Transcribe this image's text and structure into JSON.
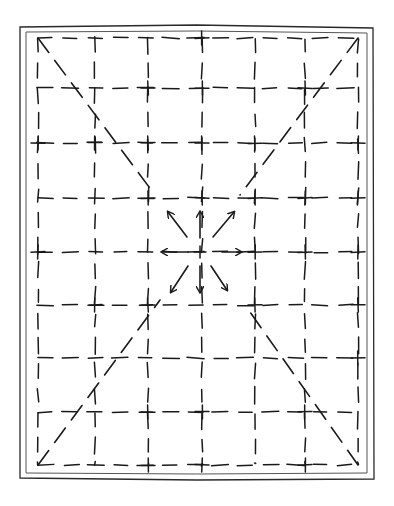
{
  "diagram": {
    "title": "",
    "type": "hand-drawn dashed grid with diagonals and radiating arrows",
    "ink_color": "#1a1a1a",
    "background": "#ffffff",
    "frame": {
      "style": "double-line border",
      "outer": {
        "x": 20,
        "y": 26,
        "w": 353,
        "h": 453
      },
      "inner": {
        "x": 26,
        "y": 31,
        "w": 341,
        "h": 442
      }
    },
    "grid": {
      "style": "dashed",
      "columns_x": [
        38,
        95,
        148,
        202,
        255,
        305,
        358
      ],
      "rows_y": [
        38,
        88,
        143,
        198,
        252,
        305,
        358,
        412,
        465
      ]
    },
    "diagonals": [
      {
        "name": "top-left-to-center",
        "from": [
          38,
          38
        ],
        "to": [
          155,
          195
        ]
      },
      {
        "name": "top-right-to-center",
        "from": [
          358,
          38
        ],
        "to": [
          240,
          195
        ]
      },
      {
        "name": "bottom-left-to-center",
        "from": [
          38,
          465
        ],
        "to": [
          160,
          300
        ]
      },
      {
        "name": "bottom-right-to-center",
        "from": [
          358,
          465
        ],
        "to": [
          245,
          305
        ]
      }
    ],
    "center": {
      "x": 200,
      "y": 252
    },
    "arrows": [
      {
        "direction": "up-left",
        "from": [
          187,
          237
        ],
        "to": [
          168,
          212
        ]
      },
      {
        "direction": "up",
        "from": [
          200,
          238
        ],
        "to": [
          200,
          212
        ]
      },
      {
        "direction": "up-right",
        "from": [
          213,
          237
        ],
        "to": [
          234,
          212
        ]
      },
      {
        "direction": "left",
        "from": [
          188,
          252
        ],
        "to": [
          162,
          252
        ]
      },
      {
        "direction": "right",
        "from": [
          222,
          252
        ],
        "to": [
          241,
          252
        ]
      },
      {
        "direction": "down-left",
        "from": [
          188,
          266
        ],
        "to": [
          171,
          292
        ]
      },
      {
        "direction": "down",
        "from": [
          200,
          266
        ],
        "to": [
          200,
          292
        ]
      },
      {
        "direction": "down-right",
        "from": [
          211,
          266
        ],
        "to": [
          227,
          290
        ]
      }
    ]
  }
}
